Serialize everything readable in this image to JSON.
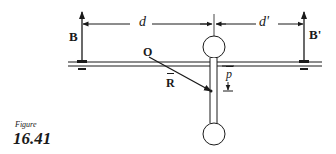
{
  "figure": {
    "caption_word": "Figure",
    "caption_number": "16.41"
  },
  "labels": {
    "B": "B",
    "B_prime": "B'",
    "d": "d",
    "d_prime": "d'",
    "O": "O",
    "R": "R",
    "R_bar": "̅",
    "p": "p"
  },
  "colors": {
    "ink": "#1a1a1a",
    "background": "#ffffff"
  }
}
